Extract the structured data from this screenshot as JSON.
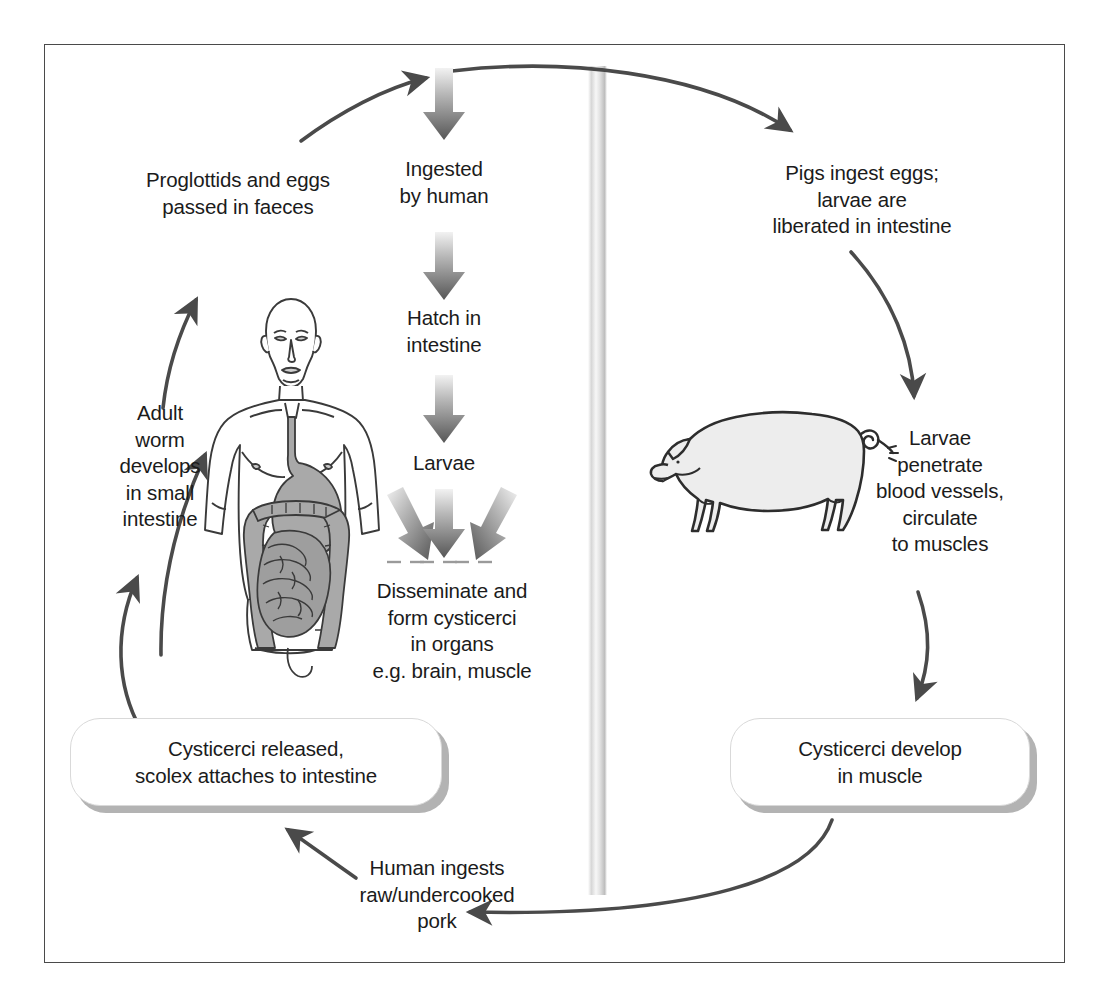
{
  "figure": {
    "caption": "",
    "frame_color": "#4a4a4a",
    "background": "#ffffff"
  },
  "colors": {
    "text": "#1b1b1b",
    "thin_arrow": "#4a4a4a",
    "block_arrow_dark": "#595959",
    "block_arrow_light": "#e8e8e8",
    "pill_shadow": "#b3b3b3",
    "divider_light": "#fbfbfb",
    "divider_dark": "#c4c4c4",
    "organ_fill": "#a9a9a9",
    "pig_fill": "#ededed"
  },
  "labels": {
    "proglottids": "Proglottids and eggs\npassed in faeces",
    "ingested_by_human": "Ingested\nby human",
    "pigs_ingest_eggs": "Pigs ingest eggs;\nlarvae are\nliberated in intestine",
    "hatch_in_intestine": "Hatch in\nintestine",
    "larvae": "Larvae",
    "adult_worm": "Adult\nworm\ndevelops\nin small\nintestine",
    "larvae_penetrate": "Larvae\npenetrate\nblood vessels,\ncirculate\nto muscles",
    "disseminate": "Disseminate and\nform cysticerci\nin organs\ne.g. brain, muscle",
    "human_ingests_pork": "Human ingests\nraw/undercooked\npork"
  },
  "boxes": {
    "cysticerci_released": "Cysticerci released,\nscolex attaches to intestine",
    "cysticerci_develop": "Cysticerci develop\nin muscle"
  },
  "illustrations": {
    "human": "human-torso-with-digestive-tract",
    "pig": "pig-side-view",
    "divider": "vertical-gradient-divider"
  },
  "arrows": {
    "to_top_center": "curved-arrow-up-right",
    "to_pig": "curved-arrow-right-down",
    "ingested": "block-arrow-down",
    "hatch": "block-arrow-down",
    "larvae": "block-arrow-down",
    "disseminate_left": "block-arrow-down-left",
    "disseminate_center": "block-arrow-down",
    "disseminate_right": "block-arrow-down-right",
    "pig_to_larvae": "curved-arrow-down",
    "larvae_to_cysticerci": "curved-arrow-down",
    "cysticerci_to_pork": "curved-arrow-left",
    "pork_to_released": "curved-arrow-up-left",
    "released_to_adult": "curved-arrow-up",
    "adult_to_proglottids": "curved-arrow-up-right"
  }
}
